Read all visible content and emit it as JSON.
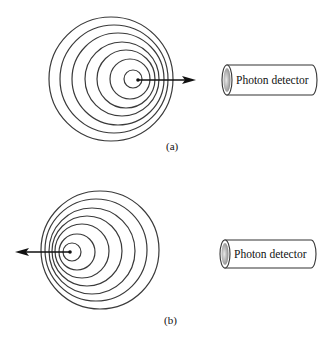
{
  "diagram": {
    "panels": [
      {
        "id": "a",
        "label": "(a)",
        "source_direction": "toward-detector",
        "rings": [
          {
            "cx": 111,
            "cy": 79,
            "r": 62
          },
          {
            "cx": 114,
            "cy": 79,
            "r": 54
          },
          {
            "cx": 118,
            "cy": 79,
            "r": 46
          },
          {
            "cx": 122,
            "cy": 79,
            "r": 37
          },
          {
            "cx": 126,
            "cy": 79,
            "r": 29
          },
          {
            "cx": 130,
            "cy": 79,
            "r": 20
          },
          {
            "cx": 133,
            "cy": 79,
            "r": 9
          }
        ],
        "arrow": {
          "x1": 138,
          "y1": 80,
          "x2": 196,
          "y2": 80
        },
        "detector": {
          "label": "Photon detector",
          "x": 222,
          "y": 65,
          "w": 95,
          "h": 30
        }
      },
      {
        "id": "b",
        "label": "(b)",
        "source_direction": "away-from-detector",
        "rings": [
          {
            "cx": 100,
            "cy": 250,
            "r": 59
          },
          {
            "cx": 96,
            "cy": 250,
            "r": 51
          },
          {
            "cx": 92,
            "cy": 251,
            "r": 43
          },
          {
            "cx": 87,
            "cy": 251,
            "r": 35
          },
          {
            "cx": 82,
            "cy": 251,
            "r": 27
          },
          {
            "cx": 77,
            "cy": 252,
            "r": 18
          },
          {
            "cx": 72,
            "cy": 252,
            "r": 9
          }
        ],
        "arrow": {
          "x1": 70,
          "y1": 252,
          "x2": 15,
          "y2": 252
        },
        "detector": {
          "label": "Photon detector",
          "x": 220,
          "y": 240,
          "w": 96,
          "h": 28
        }
      }
    ]
  },
  "colors": {
    "stroke": "#3a3a3a",
    "arrow": "#111111",
    "cap_gray": "#9a9a9a"
  }
}
